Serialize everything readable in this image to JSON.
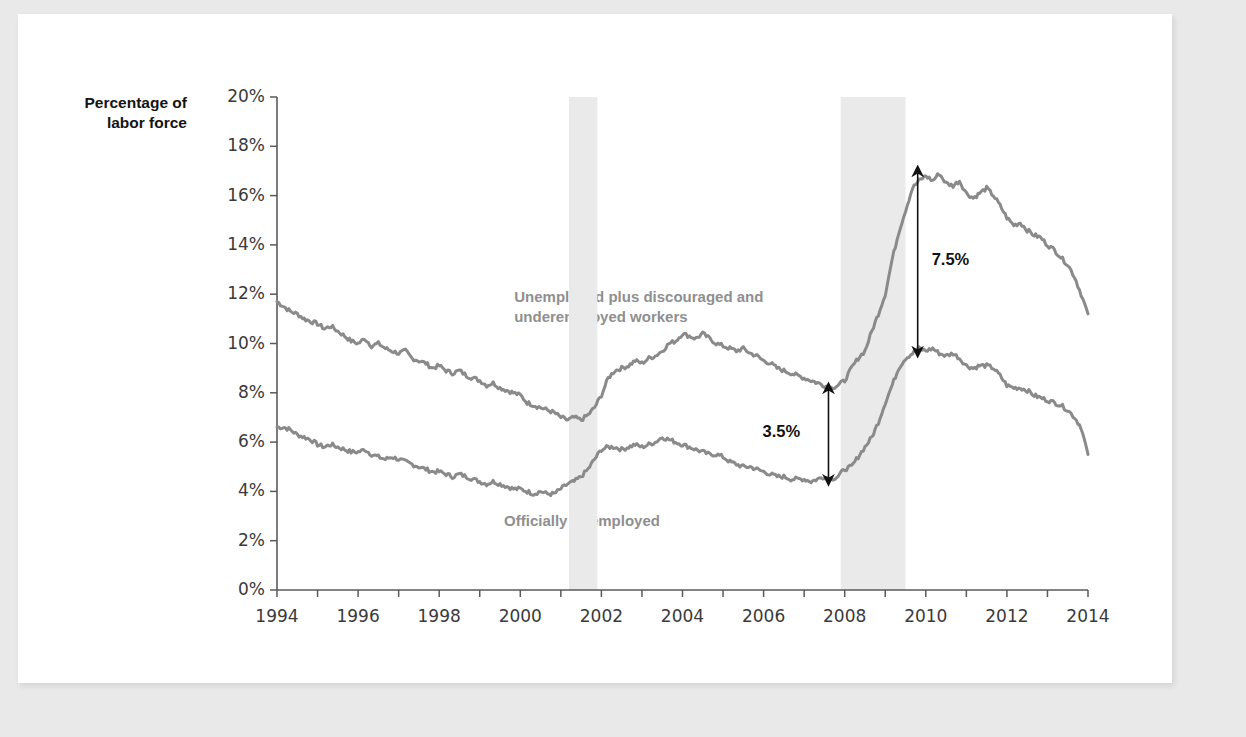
{
  "figure": {
    "y_axis_title": "Percentage of\nlabor force",
    "background_color": "#e9e9e9",
    "card_color": "#ffffff"
  },
  "series_labels": {
    "upper": "Unemployed plus discouraged and\nunderemployed workers",
    "lower": "Officially unemployed"
  },
  "annotations": [
    {
      "label": "3.5%",
      "x_year": 2007.6,
      "y_top": 8.2,
      "y_bottom": 4.45
    },
    {
      "label": "7.5%",
      "x_year": 2009.8,
      "y_top": 17.0,
      "y_bottom": 9.65
    }
  ],
  "chart_data": {
    "type": "line",
    "title": "",
    "xlabel": "",
    "ylabel": "Percentage of labor force",
    "xlim": [
      1994,
      2014
    ],
    "ylim": [
      0,
      20
    ],
    "grid": false,
    "legend_position": "inline-annotations",
    "line_color": "#8a8a8a",
    "recession_band_color": "#eaeaea",
    "xticks": [
      "1994",
      "1996",
      "1998",
      "2000",
      "2002",
      "2004",
      "2006",
      "2008",
      "2010",
      "2012",
      "2014"
    ],
    "xtick_values": [
      1994,
      1996,
      1998,
      2000,
      2002,
      2004,
      2006,
      2008,
      2010,
      2012,
      2014
    ],
    "yticks": [
      "0%",
      "2%",
      "4%",
      "6%",
      "8%",
      "10%",
      "12%",
      "14%",
      "16%",
      "18%",
      "20%"
    ],
    "ytick_values": [
      0,
      2,
      4,
      6,
      8,
      10,
      12,
      14,
      16,
      18,
      20
    ],
    "recession_bands": [
      {
        "start": 2001.2,
        "end": 2001.9
      },
      {
        "start": 2007.9,
        "end": 2009.5
      }
    ],
    "series": [
      {
        "name": "Unemployed plus discouraged and underemployed workers",
        "x": [
          1994.0,
          1994.17,
          1994.33,
          1994.5,
          1994.67,
          1994.83,
          1995.0,
          1995.17,
          1995.33,
          1995.5,
          1995.67,
          1995.83,
          1996.0,
          1996.17,
          1996.33,
          1996.5,
          1996.67,
          1996.83,
          1997.0,
          1997.17,
          1997.33,
          1997.5,
          1997.67,
          1997.83,
          1998.0,
          1998.17,
          1998.33,
          1998.5,
          1998.67,
          1998.83,
          1999.0,
          1999.17,
          1999.33,
          1999.5,
          1999.67,
          1999.83,
          2000.0,
          2000.17,
          2000.33,
          2000.5,
          2000.67,
          2000.83,
          2001.0,
          2001.17,
          2001.33,
          2001.5,
          2001.67,
          2001.83,
          2002.0,
          2002.17,
          2002.33,
          2002.5,
          2002.67,
          2002.83,
          2003.0,
          2003.17,
          2003.33,
          2003.5,
          2003.67,
          2003.83,
          2004.0,
          2004.17,
          2004.33,
          2004.5,
          2004.67,
          2004.83,
          2005.0,
          2005.17,
          2005.33,
          2005.5,
          2005.67,
          2005.83,
          2006.0,
          2006.17,
          2006.33,
          2006.5,
          2006.67,
          2006.83,
          2007.0,
          2007.17,
          2007.33,
          2007.5,
          2007.67,
          2007.83,
          2008.0,
          2008.17,
          2008.33,
          2008.5,
          2008.67,
          2008.83,
          2009.0,
          2009.17,
          2009.33,
          2009.5,
          2009.67,
          2009.83,
          2010.0,
          2010.17,
          2010.33,
          2010.5,
          2010.67,
          2010.83,
          2011.0,
          2011.17,
          2011.33,
          2011.5,
          2011.67,
          2011.83,
          2012.0,
          2012.17,
          2012.33,
          2012.5,
          2012.67,
          2012.83,
          2013.0,
          2013.17,
          2013.33,
          2013.5,
          2013.67,
          2013.83,
          2014.0
        ],
        "values": [
          11.7,
          11.5,
          11.3,
          11.2,
          11.0,
          10.9,
          10.8,
          10.6,
          10.7,
          10.5,
          10.3,
          10.1,
          10.0,
          10.2,
          9.9,
          10.0,
          9.8,
          9.7,
          9.6,
          9.7,
          9.4,
          9.3,
          9.2,
          9.0,
          9.1,
          8.9,
          8.8,
          8.9,
          8.7,
          8.6,
          8.5,
          8.3,
          8.4,
          8.2,
          8.1,
          8.0,
          7.9,
          7.6,
          7.5,
          7.4,
          7.3,
          7.2,
          7.0,
          6.9,
          7.0,
          6.9,
          7.1,
          7.4,
          7.9,
          8.6,
          8.9,
          9.0,
          9.1,
          9.3,
          9.2,
          9.4,
          9.5,
          9.7,
          10.0,
          10.1,
          10.4,
          10.3,
          10.2,
          10.4,
          10.2,
          10.0,
          9.9,
          9.8,
          9.7,
          9.8,
          9.6,
          9.5,
          9.3,
          9.2,
          9.0,
          8.9,
          8.8,
          8.7,
          8.6,
          8.5,
          8.4,
          8.3,
          8.2,
          8.3,
          8.5,
          9.0,
          9.4,
          9.7,
          10.5,
          11.2,
          12.0,
          13.4,
          14.5,
          15.4,
          16.3,
          16.6,
          16.8,
          16.6,
          16.9,
          16.5,
          16.4,
          16.6,
          16.1,
          15.9,
          16.1,
          16.3,
          16.0,
          15.6,
          15.1,
          14.8,
          14.9,
          14.6,
          14.4,
          14.3,
          14.0,
          13.8,
          13.5,
          13.2,
          12.7,
          12.0,
          11.2
        ]
      },
      {
        "name": "Officially unemployed",
        "x": [
          1994.0,
          1994.17,
          1994.33,
          1994.5,
          1994.67,
          1994.83,
          1995.0,
          1995.17,
          1995.33,
          1995.5,
          1995.67,
          1995.83,
          1996.0,
          1996.17,
          1996.33,
          1996.5,
          1996.67,
          1996.83,
          1997.0,
          1997.17,
          1997.33,
          1997.5,
          1997.67,
          1997.83,
          1998.0,
          1998.17,
          1998.33,
          1998.5,
          1998.67,
          1998.83,
          1999.0,
          1999.17,
          1999.33,
          1999.5,
          1999.67,
          1999.83,
          2000.0,
          2000.17,
          2000.33,
          2000.5,
          2000.67,
          2000.83,
          2001.0,
          2001.17,
          2001.33,
          2001.5,
          2001.67,
          2001.83,
          2002.0,
          2002.17,
          2002.33,
          2002.5,
          2002.67,
          2002.83,
          2003.0,
          2003.17,
          2003.33,
          2003.5,
          2003.67,
          2003.83,
          2004.0,
          2004.17,
          2004.33,
          2004.5,
          2004.67,
          2004.83,
          2005.0,
          2005.17,
          2005.33,
          2005.5,
          2005.67,
          2005.83,
          2006.0,
          2006.17,
          2006.33,
          2006.5,
          2006.67,
          2006.83,
          2007.0,
          2007.17,
          2007.33,
          2007.5,
          2007.67,
          2007.83,
          2008.0,
          2008.17,
          2008.33,
          2008.5,
          2008.67,
          2008.83,
          2009.0,
          2009.17,
          2009.33,
          2009.5,
          2009.67,
          2009.83,
          2010.0,
          2010.17,
          2010.33,
          2010.5,
          2010.67,
          2010.83,
          2011.0,
          2011.17,
          2011.33,
          2011.5,
          2011.67,
          2011.83,
          2012.0,
          2012.17,
          2012.33,
          2012.5,
          2012.67,
          2012.83,
          2013.0,
          2013.17,
          2013.33,
          2013.5,
          2013.67,
          2013.83,
          2014.0
        ],
        "values": [
          6.6,
          6.6,
          6.5,
          6.3,
          6.2,
          6.1,
          5.9,
          5.8,
          5.9,
          5.8,
          5.7,
          5.6,
          5.6,
          5.7,
          5.5,
          5.4,
          5.3,
          5.4,
          5.3,
          5.2,
          5.1,
          5.0,
          4.9,
          4.8,
          4.8,
          4.7,
          4.6,
          4.7,
          4.6,
          4.5,
          4.4,
          4.3,
          4.4,
          4.3,
          4.2,
          4.1,
          4.1,
          4.0,
          3.9,
          4.0,
          3.9,
          3.9,
          4.1,
          4.3,
          4.4,
          4.6,
          4.9,
          5.3,
          5.7,
          5.8,
          5.8,
          5.7,
          5.8,
          5.9,
          5.8,
          5.9,
          6.0,
          6.2,
          6.1,
          6.0,
          5.9,
          5.8,
          5.7,
          5.6,
          5.5,
          5.5,
          5.4,
          5.2,
          5.1,
          5.0,
          5.0,
          4.9,
          4.8,
          4.7,
          4.6,
          4.6,
          4.5,
          4.5,
          4.5,
          4.4,
          4.5,
          4.6,
          4.5,
          4.6,
          4.9,
          5.0,
          5.4,
          5.8,
          6.2,
          6.8,
          7.6,
          8.3,
          9.0,
          9.4,
          9.6,
          9.8,
          9.7,
          9.8,
          9.6,
          9.5,
          9.6,
          9.4,
          9.1,
          9.0,
          9.1,
          9.1,
          9.0,
          8.7,
          8.3,
          8.2,
          8.2,
          8.1,
          7.9,
          7.8,
          7.7,
          7.6,
          7.5,
          7.3,
          7.0,
          6.6,
          5.5
        ]
      }
    ]
  }
}
